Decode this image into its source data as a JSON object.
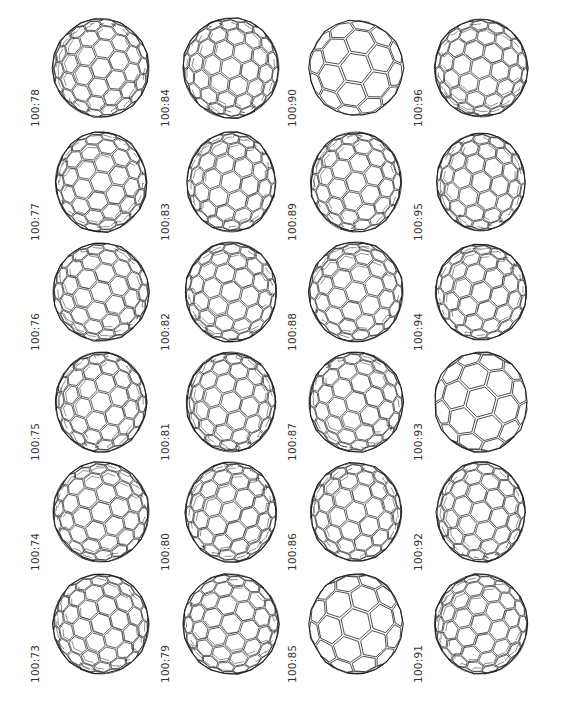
{
  "figure": {
    "columns": 4,
    "rows": 6,
    "stroke_color": "#222222",
    "label_color": "#333333",
    "background": "#ffffff"
  },
  "cells": [
    {
      "label": "100:78",
      "col": 0,
      "row": 0,
      "style": "dense",
      "shape": [
        1.0,
        0.98
      ],
      "seed": 1
    },
    {
      "label": "100:84",
      "col": 1,
      "row": 0,
      "style": "dense",
      "shape": [
        1.0,
        1.0
      ],
      "seed": 2
    },
    {
      "label": "100:90",
      "col": 2,
      "row": 0,
      "style": "sparse",
      "shape": [
        0.98,
        0.95
      ],
      "seed": 3
    },
    {
      "label": "100:96",
      "col": 3,
      "row": 0,
      "style": "dense",
      "shape": [
        0.97,
        0.98
      ],
      "seed": 4
    },
    {
      "label": "100:77",
      "col": 0,
      "row": 1,
      "style": "dense",
      "shape": [
        0.95,
        1.0
      ],
      "seed": 5
    },
    {
      "label": "100:83",
      "col": 1,
      "row": 1,
      "style": "dense",
      "shape": [
        0.92,
        1.0
      ],
      "seed": 6
    },
    {
      "label": "100:89",
      "col": 2,
      "row": 1,
      "style": "dense",
      "shape": [
        0.95,
        1.0
      ],
      "seed": 7
    },
    {
      "label": "100:95",
      "col": 3,
      "row": 1,
      "style": "dense",
      "shape": [
        0.92,
        0.98
      ],
      "seed": 8
    },
    {
      "label": "100:76",
      "col": 0,
      "row": 2,
      "style": "dense",
      "shape": [
        1.0,
        0.98
      ],
      "seed": 9
    },
    {
      "label": "100:82",
      "col": 1,
      "row": 2,
      "style": "dense",
      "shape": [
        0.95,
        1.0
      ],
      "seed": 10
    },
    {
      "label": "100:88",
      "col": 2,
      "row": 2,
      "style": "dense",
      "shape": [
        0.98,
        1.0
      ],
      "seed": 11
    },
    {
      "label": "100:94",
      "col": 3,
      "row": 2,
      "style": "dense",
      "shape": [
        0.95,
        0.95
      ],
      "seed": 12
    },
    {
      "label": "100:75",
      "col": 0,
      "row": 3,
      "style": "dense",
      "shape": [
        0.95,
        1.0
      ],
      "seed": 13
    },
    {
      "label": "100:81",
      "col": 1,
      "row": 3,
      "style": "dense",
      "shape": [
        0.93,
        1.0
      ],
      "seed": 14
    },
    {
      "label": "100:87",
      "col": 2,
      "row": 3,
      "style": "dense",
      "shape": [
        0.98,
        1.0
      ],
      "seed": 15
    },
    {
      "label": "100:93",
      "col": 3,
      "row": 3,
      "style": "sparse",
      "shape": [
        0.97,
        1.0
      ],
      "seed": 16
    },
    {
      "label": "100:74",
      "col": 0,
      "row": 4,
      "style": "dense",
      "shape": [
        1.0,
        1.0
      ],
      "seed": 17
    },
    {
      "label": "100:80",
      "col": 1,
      "row": 4,
      "style": "dense",
      "shape": [
        0.95,
        1.0
      ],
      "seed": 18
    },
    {
      "label": "100:86",
      "col": 2,
      "row": 4,
      "style": "dense",
      "shape": [
        0.95,
        0.98
      ],
      "seed": 19
    },
    {
      "label": "100:92",
      "col": 3,
      "row": 4,
      "style": "dense",
      "shape": [
        0.92,
        1.0
      ],
      "seed": 20
    },
    {
      "label": "100:73",
      "col": 0,
      "row": 5,
      "style": "dense",
      "shape": [
        1.0,
        1.0
      ],
      "seed": 21
    },
    {
      "label": "100:79",
      "col": 1,
      "row": 5,
      "style": "dense",
      "shape": [
        1.0,
        1.0
      ],
      "seed": 22
    },
    {
      "label": "100:85",
      "col": 2,
      "row": 5,
      "style": "sparse",
      "shape": [
        0.97,
        1.0
      ],
      "seed": 23
    },
    {
      "label": "100:91",
      "col": 3,
      "row": 5,
      "style": "dense",
      "shape": [
        0.97,
        1.0
      ],
      "seed": 24
    }
  ]
}
